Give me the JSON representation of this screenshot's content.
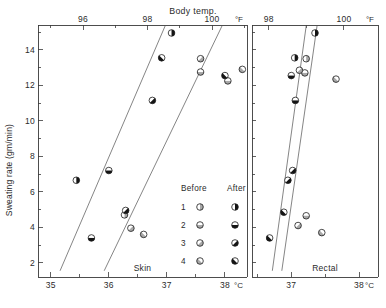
{
  "figure": {
    "title": "Body temp.",
    "y_axis_label": "Sweating rate (gm/min)"
  },
  "legend": {
    "before_header": "Before",
    "after_header": "After",
    "rows": [
      {
        "subject": "1",
        "before_symbol": "open-circle-vertical-bar",
        "after_symbol": "circle-right-half-filled"
      },
      {
        "subject": "2",
        "before_symbol": "open-circle-horizontal-bar",
        "after_symbol": "circle-bottom-half-filled"
      },
      {
        "subject": "3",
        "before_symbol": "open-circle-diagonal-bar",
        "after_symbol": "circle-diagonal-filled"
      },
      {
        "subject": "4",
        "before_symbol": "open-circle-anti-diagonal-bar",
        "after_symbol": "circle-anti-diagonal-filled"
      }
    ]
  },
  "chart_data": {
    "type": "scatter",
    "title": "Body temp.",
    "ylabel": "Sweating rate (gm/min)",
    "ylim": [
      1.2,
      15.4
    ],
    "yticks_major": [
      2,
      4,
      6,
      8,
      10,
      12,
      14
    ],
    "yticks_minor": [
      3,
      5,
      7,
      9,
      11,
      13,
      15
    ],
    "grid": false,
    "legend_position": "inside-lower-center-left-panel",
    "panels": [
      {
        "name": "Skin",
        "panel_label": "Skin",
        "xlabel_celsius": "°C",
        "xlabel_fahrenheit": "°F",
        "xlim_celsius": [
          34.78,
          38.38
        ],
        "xticks_celsius_major": [
          35,
          36,
          37,
          38
        ],
        "xticks_celsius_minor": [
          35.5,
          36.5,
          37.5
        ],
        "xticks_fahrenheit_major": [
          96,
          98,
          100
        ],
        "xticks_fahrenheit_minor": [
          95,
          97,
          99,
          101
        ],
        "series": [
          {
            "name": "Before",
            "points": [
              {
                "subject": 1,
                "x_celsius": 36.27,
                "y": 4.7
              },
              {
                "subject": 2,
                "x_celsius": 37.58,
                "y": 12.75
              },
              {
                "subject": 2,
                "x_celsius": 38.05,
                "y": 12.25
              },
              {
                "subject": 3,
                "x_celsius": 36.38,
                "y": 3.95
              },
              {
                "subject": 3,
                "x_celsius": 37.58,
                "y": 13.5
              },
              {
                "subject": 4,
                "x_celsius": 36.6,
                "y": 3.6
              },
              {
                "subject": 4,
                "x_celsius": 38.3,
                "y": 12.9
              }
            ]
          },
          {
            "name": "After",
            "points": [
              {
                "subject": 1,
                "x_celsius": 35.44,
                "y": 6.65
              },
              {
                "subject": 1,
                "x_celsius": 37.08,
                "y": 14.95
              },
              {
                "subject": 2,
                "x_celsius": 35.7,
                "y": 3.4
              },
              {
                "subject": 2,
                "x_celsius": 36.0,
                "y": 7.2
              },
              {
                "subject": 3,
                "x_celsius": 36.29,
                "y": 4.95
              },
              {
                "subject": 3,
                "x_celsius": 36.75,
                "y": 11.15
              },
              {
                "subject": 4,
                "x_celsius": 36.91,
                "y": 13.55
              },
              {
                "subject": 4,
                "x_celsius": 38.0,
                "y": 12.55
              }
            ]
          }
        ],
        "regression_lines": [
          {
            "name": "After",
            "x1_celsius": 35.16,
            "y1": 1.55,
            "x2_celsius": 36.97,
            "y2": 15.35
          },
          {
            "name": "Before",
            "x1_celsius": 35.92,
            "y1": 1.55,
            "x2_celsius": 37.95,
            "y2": 15.35
          }
        ]
      },
      {
        "name": "Rectal",
        "panel_label": "Rectal",
        "xlabel_celsius": "°C",
        "xlabel_fahrenheit": "°F",
        "xlim_celsius": [
          36.42,
          38.28
        ],
        "xticks_celsius_major": [
          37,
          38
        ],
        "xticks_celsius_minor": [
          36.5,
          37.5
        ],
        "xticks_fahrenheit_major": [
          98,
          100
        ],
        "xticks_fahrenheit_minor": [
          97,
          99,
          101
        ],
        "series": [
          {
            "name": "Before",
            "points": [
              {
                "subject": 1,
                "x_celsius": 37.22,
                "y": 13.5
              },
              {
                "subject": 2,
                "x_celsius": 37.2,
                "y": 12.7
              },
              {
                "subject": 2,
                "x_celsius": 37.22,
                "y": 4.65
              },
              {
                "subject": 3,
                "x_celsius": 37.12,
                "y": 12.85
              },
              {
                "subject": 3,
                "x_celsius": 37.1,
                "y": 4.1
              },
              {
                "subject": 4,
                "x_celsius": 37.66,
                "y": 12.35
              },
              {
                "subject": 4,
                "x_celsius": 37.45,
                "y": 3.7
              }
            ]
          },
          {
            "name": "After",
            "points": [
              {
                "subject": 1,
                "x_celsius": 37.35,
                "y": 14.95
              },
              {
                "subject": 1,
                "x_celsius": 37.05,
                "y": 13.55
              },
              {
                "subject": 2,
                "x_celsius": 37.0,
                "y": 12.55
              },
              {
                "subject": 2,
                "x_celsius": 37.06,
                "y": 11.15
              },
              {
                "subject": 3,
                "x_celsius": 37.02,
                "y": 7.2
              },
              {
                "subject": 3,
                "x_celsius": 36.95,
                "y": 6.65
              },
              {
                "subject": 4,
                "x_celsius": 36.89,
                "y": 4.85
              },
              {
                "subject": 4,
                "x_celsius": 36.68,
                "y": 3.4
              }
            ]
          }
        ],
        "regression_lines": [
          {
            "name": "After",
            "x1_celsius": 36.72,
            "y1": 1.55,
            "x2_celsius": 37.22,
            "y2": 15.35
          },
          {
            "name": "Before",
            "x1_celsius": 36.86,
            "y1": 1.55,
            "x2_celsius": 37.38,
            "y2": 15.35
          }
        ]
      }
    ]
  }
}
